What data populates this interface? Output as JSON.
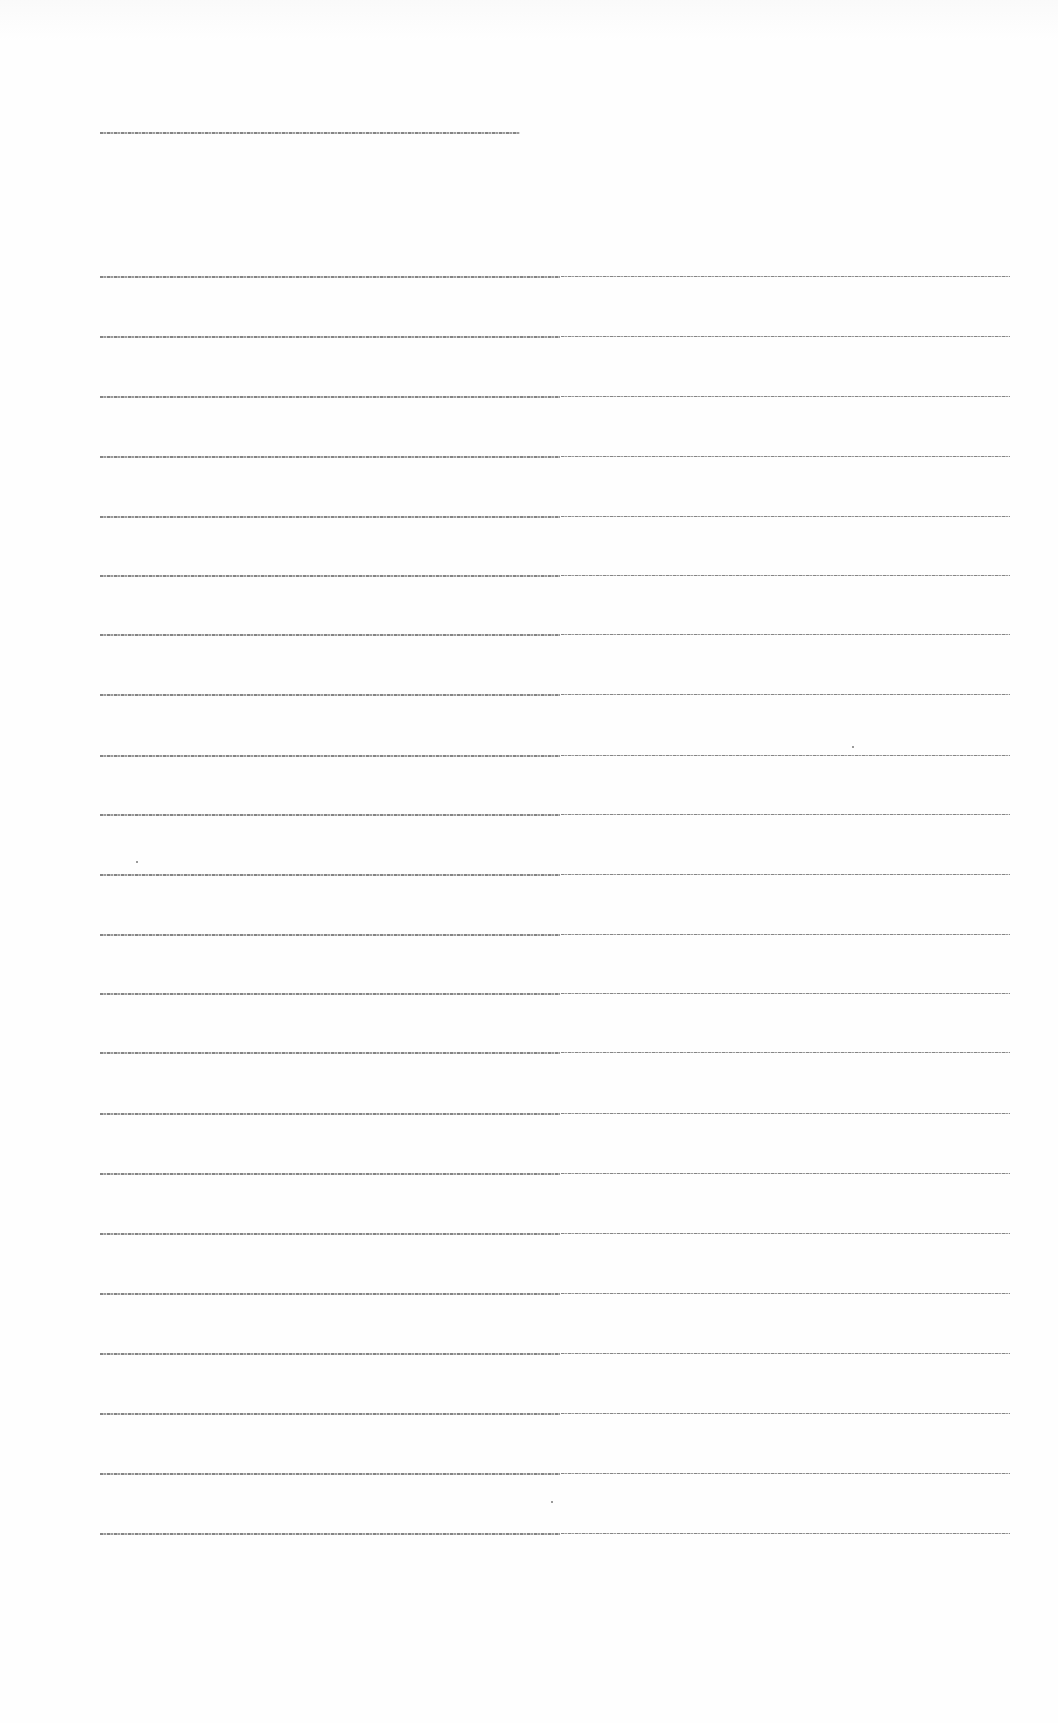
{
  "document": {
    "type": "scanned-text-page",
    "legibility": "text rendered at ~1-2px height; characters not resolvable",
    "header_line": {
      "text": "",
      "x": 100,
      "y": 132,
      "width": 420
    },
    "body_lines": [
      {
        "index": 1,
        "y": 254,
        "left": {
          "text": ""
        },
        "right": {
          "text": ""
        }
      },
      {
        "index": 2,
        "y": 314,
        "left": {
          "text": ""
        },
        "right": {
          "text": ""
        }
      },
      {
        "index": 3,
        "y": 374,
        "left": {
          "text": ""
        },
        "right": {
          "text": ""
        }
      },
      {
        "index": 4,
        "y": 434,
        "left": {
          "text": ""
        },
        "right": {
          "text": ""
        }
      },
      {
        "index": 5,
        "y": 494,
        "left": {
          "text": ""
        },
        "right": {
          "text": ""
        }
      },
      {
        "index": 6,
        "y": 553,
        "left": {
          "text": ""
        },
        "right": {
          "text": ""
        }
      },
      {
        "index": 7,
        "y": 612,
        "left": {
          "text": ""
        },
        "right": {
          "text": ""
        }
      },
      {
        "index": 8,
        "y": 672,
        "left": {
          "text": ""
        },
        "right": {
          "text": ""
        }
      },
      {
        "index": 9,
        "y": 733,
        "left": {
          "text": ""
        },
        "right": {
          "text": ""
        }
      },
      {
        "index": 10,
        "y": 792,
        "left": {
          "text": ""
        },
        "right": {
          "text": ""
        }
      },
      {
        "index": 11,
        "y": 852,
        "left": {
          "text": ""
        },
        "right": {
          "text": ""
        }
      },
      {
        "index": 12,
        "y": 912,
        "left": {
          "text": ""
        },
        "right": {
          "text": ""
        }
      },
      {
        "index": 13,
        "y": 971,
        "left": {
          "text": ""
        },
        "right": {
          "text": ""
        }
      },
      {
        "index": 14,
        "y": 1030,
        "left": {
          "text": ""
        },
        "right": {
          "text": ""
        }
      },
      {
        "index": 15,
        "y": 1091,
        "left": {
          "text": ""
        },
        "right": {
          "text": ""
        }
      },
      {
        "index": 16,
        "y": 1151,
        "left": {
          "text": ""
        },
        "right": {
          "text": ""
        }
      },
      {
        "index": 17,
        "y": 1211,
        "left": {
          "text": ""
        },
        "right": {
          "text": ""
        }
      },
      {
        "index": 18,
        "y": 1271,
        "left": {
          "text": ""
        },
        "right": {
          "text": ""
        }
      },
      {
        "index": 19,
        "y": 1331,
        "left": {
          "text": ""
        },
        "right": {
          "text": ""
        }
      },
      {
        "index": 20,
        "y": 1391,
        "left": {
          "text": ""
        },
        "right": {
          "text": ""
        }
      },
      {
        "index": 21,
        "y": 1451,
        "left": {
          "text": ""
        },
        "right": {
          "text": ""
        }
      },
      {
        "index": 22,
        "y": 1511,
        "left": {
          "text": ""
        },
        "right": {
          "text": ""
        }
      }
    ],
    "column_split_x": 560,
    "line_left_x": 100,
    "line_right_end_x": 1010
  },
  "colors": {
    "background": "#ffffff",
    "text_ink": "#6f6f6f"
  }
}
